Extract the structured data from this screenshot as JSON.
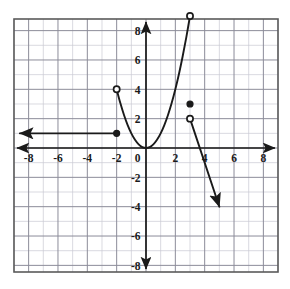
{
  "figure": {
    "width": 290,
    "height": 289,
    "background_color": "#ffffff"
  },
  "chart_data": {
    "type": "line",
    "title": "",
    "xlabel": "",
    "ylabel": "",
    "xlim": [
      -9,
      9
    ],
    "ylim": [
      -8.8,
      8.6
    ],
    "grid": true,
    "grid_step": 1,
    "legend": "none",
    "axis_ticks": {
      "x": [
        "-8",
        "-6",
        "-4",
        "-2",
        "0",
        "2",
        "4",
        "6",
        "8"
      ],
      "x_values": [
        -8,
        -6,
        -4,
        -2,
        0,
        2,
        4,
        6,
        8
      ],
      "y": [
        "8",
        "6",
        "4",
        "2",
        "0",
        "-2",
        "-4",
        "-6",
        "-8"
      ],
      "y_values": [
        8,
        6,
        4,
        2,
        0,
        -2,
        -4,
        -6,
        -8
      ]
    },
    "origin_label": "0",
    "colors": {
      "curve": "#1a1a1a",
      "axis": "#1a1a1a",
      "grid_major": "#8c8c99",
      "grid_minor": "#c9c9d2",
      "frame": "#5a5a5a",
      "open_point_fill": "#ffffff"
    },
    "series": [
      {
        "name": "constant-ray",
        "kind": "ray",
        "equation": "y = 1",
        "domain": "x <= -2",
        "points": [
          [
            -8.6,
            1
          ],
          [
            -2,
            1
          ]
        ],
        "start_arrow": true,
        "end_arrow": false
      },
      {
        "name": "parabola",
        "kind": "curve",
        "equation": "y = x^2",
        "domain": "-2 < x < 3",
        "points": [
          [
            -2,
            4
          ],
          [
            -1.75,
            3.0625
          ],
          [
            -1.5,
            2.25
          ],
          [
            -1.25,
            1.5625
          ],
          [
            -1,
            1
          ],
          [
            -0.75,
            0.5625
          ],
          [
            -0.5,
            0.25
          ],
          [
            -0.25,
            0.0625
          ],
          [
            0,
            0
          ],
          [
            0.25,
            0.0625
          ],
          [
            0.5,
            0.25
          ],
          [
            0.75,
            0.5625
          ],
          [
            1,
            1
          ],
          [
            1.25,
            1.5625
          ],
          [
            1.5,
            2.25
          ],
          [
            1.75,
            3.0625
          ],
          [
            2,
            4
          ],
          [
            2.25,
            5.0625
          ],
          [
            2.5,
            6.25
          ],
          [
            2.75,
            7.5625
          ],
          [
            3,
            9
          ]
        ],
        "start_arrow": false,
        "end_arrow": false
      },
      {
        "name": "decreasing-ray",
        "kind": "ray",
        "equation": "y = -3x + 11",
        "domain": "x > 3",
        "points": [
          [
            3,
            2
          ],
          [
            5,
            -4
          ]
        ],
        "start_arrow": false,
        "end_arrow": true
      }
    ],
    "markers": [
      {
        "name": "closed-point-neg2-1",
        "x": -2,
        "y": 1,
        "style": "closed",
        "label": "(-2, 1)"
      },
      {
        "name": "open-point-neg2-4",
        "x": -2,
        "y": 4,
        "style": "open",
        "label": "(-2, 4)"
      },
      {
        "name": "open-point-3-9",
        "x": 3,
        "y": 9,
        "style": "open",
        "label": "(3, 9)"
      },
      {
        "name": "closed-point-3-3",
        "x": 3,
        "y": 3,
        "style": "closed",
        "label": "(3, 3)"
      },
      {
        "name": "open-point-3-2",
        "x": 3,
        "y": 2,
        "style": "open",
        "label": "(3, 2)"
      }
    ]
  }
}
